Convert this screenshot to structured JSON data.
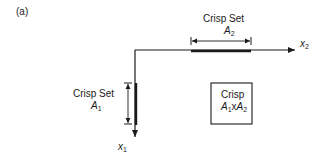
{
  "figure": {
    "panel_label": "(a)",
    "axes": {
      "horizontal": {
        "name": "x",
        "sub": "2"
      },
      "vertical": {
        "name": "x",
        "sub": "1"
      }
    },
    "set_a2": {
      "title": "Crisp Set",
      "symbol": "A",
      "sub": "2"
    },
    "set_a1": {
      "title": "Crisp Set",
      "symbol": "A",
      "sub": "1"
    },
    "product_box": {
      "title": "Crisp",
      "term1": "A",
      "term1_sub": "1",
      "op": "x",
      "term2": "A",
      "term2_sub": "2"
    },
    "colors": {
      "line": "#1a1a1a",
      "background": "#ffffff"
    }
  }
}
